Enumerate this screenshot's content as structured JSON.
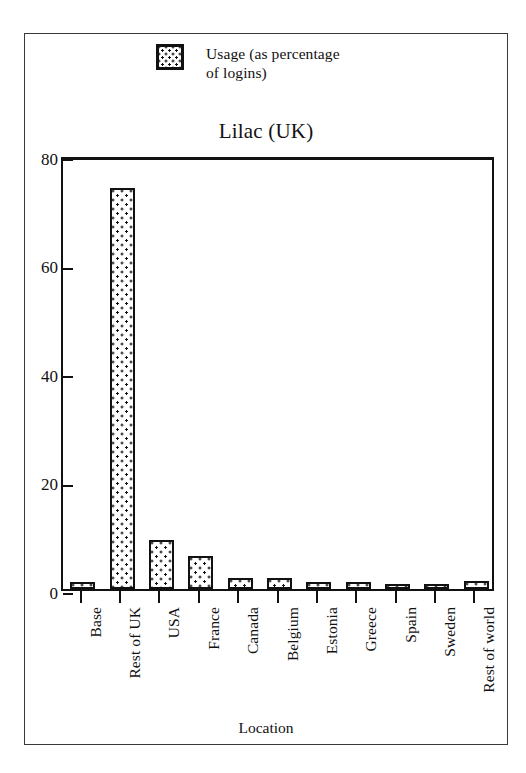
{
  "chart_data": {
    "type": "bar",
    "title": "Lilac (UK)",
    "xlabel": "Location",
    "ylabel": "",
    "ylim": [
      0,
      80
    ],
    "yticks": [
      0,
      20,
      40,
      60,
      80
    ],
    "ytick_labels": [
      "0",
      "20",
      "40",
      "60",
      "80"
    ],
    "grid": false,
    "legend_position": "top-center",
    "legend": [
      "Usage (as percentage\nof logins)"
    ],
    "categories": [
      "Base",
      "Rest of UK",
      "USA",
      "France",
      "Canada",
      "Belgium",
      "Estonia",
      "Greece",
      "Spain",
      "Sweden",
      "Rest of world"
    ],
    "series": [
      {
        "name": "Usage (as percentage of logins)",
        "values": [
          1.3,
          74.0,
          9.0,
          6.0,
          2.0,
          2.0,
          1.3,
          1.3,
          0.6,
          0.4,
          1.4
        ]
      }
    ]
  },
  "legend": {
    "swatch_name": "dotted-pattern-swatch",
    "label": "Usage (as percentage\nof logins)"
  },
  "axes": {
    "x_title": "Location",
    "y_title": ""
  },
  "colors": {
    "ink": "#111111",
    "frame": "#3a3a3a",
    "background": "#ffffff"
  }
}
